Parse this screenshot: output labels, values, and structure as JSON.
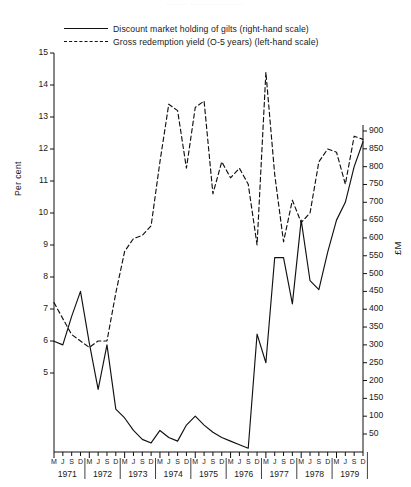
{
  "faint_header": "·······  ···········  ······",
  "legend": {
    "items": [
      {
        "key": "solid",
        "label": "Discount market holding of gilts (right-hand scale)"
      },
      {
        "key": "dashed",
        "label": "Gross redemption yield (O-5 years) (left-hand scale)"
      }
    ]
  },
  "axes": {
    "left_title": "Per cent",
    "right_title": "£M",
    "left_ticks": [
      "15",
      "14",
      "13",
      "12",
      "11",
      "10",
      "9",
      "8",
      "7",
      "6",
      "5"
    ],
    "right_ticks": [
      "900",
      "850",
      "800",
      "750",
      "700",
      "650",
      "600",
      "550",
      "500",
      "450",
      "400",
      "350",
      "300",
      "250",
      "200",
      "150",
      "100",
      "50"
    ],
    "quarter_labels": [
      "M",
      "J",
      "S",
      "D"
    ],
    "years": [
      "1971",
      "1972",
      "1973",
      "1974",
      "1975",
      "1976",
      "1977",
      "1978",
      "1979"
    ]
  },
  "chart_data": {
    "type": "line",
    "title": "",
    "xlabel": "",
    "ylabel": "Per cent",
    "ylabel_right": "£M",
    "ylim": [
      4.5,
      15
    ],
    "ylim_right": [
      0,
      925
    ],
    "grid": false,
    "legend_position": "top",
    "x": [
      "M 1971",
      "J 1971",
      "S 1971",
      "D 1971",
      "M 1972",
      "J 1972",
      "S 1972",
      "D 1972",
      "M 1973",
      "J 1973",
      "S 1973",
      "D 1973",
      "M 1974",
      "J 1974",
      "S 1974",
      "D 1974",
      "M 1975",
      "J 1975",
      "S 1975",
      "D 1975",
      "M 1976",
      "J 1976",
      "S 1976",
      "D 1976",
      "M 1977",
      "J 1977",
      "S 1977",
      "D 1977",
      "M 1978",
      "J 1978",
      "S 1978",
      "D 1978",
      "M 1979",
      "J 1979",
      "S 1979",
      "D 1979"
    ],
    "series": [
      {
        "name": "Discount market holding of gilts (right-hand scale)",
        "axis": "right",
        "unit": "£M",
        "style": "solid",
        "values": [
          310,
          300,
          380,
          450,
          305,
          175,
          300,
          120,
          95,
          60,
          35,
          25,
          60,
          40,
          30,
          75,
          100,
          75,
          55,
          40,
          30,
          20,
          10,
          330,
          250,
          545,
          545,
          415,
          650,
          480,
          455,
          560,
          650,
          700,
          800,
          870
        ]
      },
      {
        "name": "Gross redemption yield (O-5 years) (left-hand scale)",
        "axis": "left",
        "unit": "per cent",
        "style": "dashed",
        "values": [
          7.2,
          6.7,
          6.2,
          6.0,
          5.8,
          6.0,
          6.0,
          7.5,
          8.8,
          9.2,
          9.3,
          9.6,
          11.6,
          13.4,
          13.2,
          11.4,
          13.3,
          13.5,
          10.6,
          11.6,
          11.1,
          11.4,
          10.9,
          9.0,
          14.4,
          11.2,
          9.1,
          10.4,
          9.7,
          10.0,
          11.6,
          12.0,
          11.9,
          10.9,
          12.4,
          12.3
        ]
      }
    ]
  }
}
